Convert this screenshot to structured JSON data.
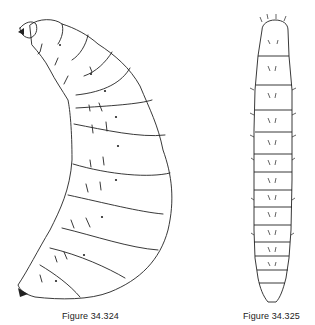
{
  "figures": [
    {
      "caption": "Figure 34.324",
      "subject": "larva-lateral-view"
    },
    {
      "caption": "Figure 34.325",
      "subject": "larva-dorsal-view"
    }
  ]
}
